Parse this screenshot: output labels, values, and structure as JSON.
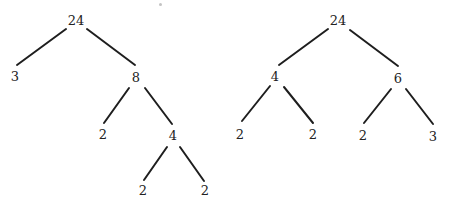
{
  "diagram": {
    "type": "factor-trees",
    "trees": [
      {
        "name": "left-factor-tree",
        "nodes": [
          {
            "id": "L0",
            "label": "24",
            "x": 76,
            "y": 20
          },
          {
            "id": "L1",
            "label": "3",
            "x": 15,
            "y": 76
          },
          {
            "id": "L2",
            "label": "8",
            "x": 136,
            "y": 77
          },
          {
            "id": "L3",
            "label": "2",
            "x": 103,
            "y": 134
          },
          {
            "id": "L4",
            "label": "4",
            "x": 173,
            "y": 135
          },
          {
            "id": "L5",
            "label": "2",
            "x": 143,
            "y": 190
          },
          {
            "id": "L6",
            "label": "2",
            "x": 205,
            "y": 190
          }
        ],
        "edges": [
          {
            "from": "L0",
            "to": "L1",
            "x1": 66,
            "y1": 29,
            "x2": 17,
            "y2": 65
          },
          {
            "from": "L0",
            "to": "L2",
            "x1": 87,
            "y1": 29,
            "x2": 135,
            "y2": 65
          },
          {
            "from": "L2",
            "to": "L3",
            "x1": 129,
            "y1": 88,
            "x2": 104,
            "y2": 123
          },
          {
            "from": "L2",
            "to": "L4",
            "x1": 145,
            "y1": 88,
            "x2": 172,
            "y2": 124
          },
          {
            "from": "L4",
            "to": "L5",
            "x1": 167,
            "y1": 147,
            "x2": 144,
            "y2": 180
          },
          {
            "from": "L4",
            "to": "L6",
            "x1": 180,
            "y1": 147,
            "x2": 204,
            "y2": 181
          }
        ]
      },
      {
        "name": "right-factor-tree",
        "nodes": [
          {
            "id": "R0",
            "label": "24",
            "x": 338,
            "y": 20
          },
          {
            "id": "R1",
            "label": "4",
            "x": 275,
            "y": 76
          },
          {
            "id": "R2",
            "label": "6",
            "x": 398,
            "y": 78
          },
          {
            "id": "R3",
            "label": "2",
            "x": 240,
            "y": 134
          },
          {
            "id": "R4",
            "label": "2",
            "x": 313,
            "y": 134
          },
          {
            "id": "R5",
            "label": "2",
            "x": 363,
            "y": 135
          },
          {
            "id": "R6",
            "label": "3",
            "x": 433,
            "y": 136
          }
        ],
        "edges": [
          {
            "from": "R0",
            "to": "R1",
            "x1": 328,
            "y1": 29,
            "x2": 279,
            "y2": 65
          },
          {
            "from": "R0",
            "to": "R2",
            "x1": 350,
            "y1": 30,
            "x2": 398,
            "y2": 66
          },
          {
            "from": "R1",
            "to": "R3",
            "x1": 270,
            "y1": 86,
            "x2": 242,
            "y2": 121
          },
          {
            "from": "R1",
            "to": "R4",
            "x1": 284,
            "y1": 87,
            "x2": 313,
            "y2": 123
          },
          {
            "from": "R2",
            "to": "R5",
            "x1": 391,
            "y1": 89,
            "x2": 364,
            "y2": 123
          },
          {
            "from": "R2",
            "to": "R6",
            "x1": 406,
            "y1": 89,
            "x2": 433,
            "y2": 124
          }
        ]
      }
    ]
  }
}
